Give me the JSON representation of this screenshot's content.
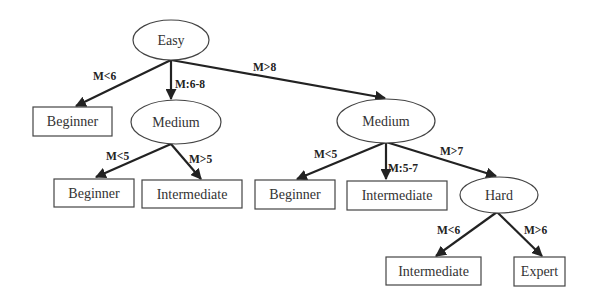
{
  "diagram": {
    "type": "decision-tree",
    "nodes": {
      "easy": {
        "label": "Easy",
        "shape": "ellipse"
      },
      "beginner_1": {
        "label": "Beginner",
        "shape": "rect"
      },
      "medium_left": {
        "label": "Medium",
        "shape": "ellipse"
      },
      "medium_right": {
        "label": "Medium",
        "shape": "ellipse"
      },
      "beginner_2": {
        "label": "Beginner",
        "shape": "rect"
      },
      "intermediate_1": {
        "label": "Intermediate",
        "shape": "rect"
      },
      "beginner_3": {
        "label": "Beginner",
        "shape": "rect"
      },
      "intermediate_2": {
        "label": "Intermediate",
        "shape": "rect"
      },
      "hard": {
        "label": "Hard",
        "shape": "ellipse"
      },
      "intermediate_3": {
        "label": "Intermediate",
        "shape": "rect"
      },
      "expert": {
        "label": "Expert",
        "shape": "rect"
      }
    },
    "edges": {
      "easy_beginner": {
        "from": "easy",
        "to": "beginner_1",
        "label": "M<6"
      },
      "easy_medium_left": {
        "from": "easy",
        "to": "medium_left",
        "label": "M:6-8"
      },
      "easy_medium_right": {
        "from": "easy",
        "to": "medium_right",
        "label": "M>8"
      },
      "medl_beginner": {
        "from": "medium_left",
        "to": "beginner_2",
        "label": "M<5"
      },
      "medl_intermediate": {
        "from": "medium_left",
        "to": "intermediate_1",
        "label": "M>5"
      },
      "medr_beginner": {
        "from": "medium_right",
        "to": "beginner_3",
        "label": "M<5"
      },
      "medr_intermediate": {
        "from": "medium_right",
        "to": "intermediate_2",
        "label": "M:5-7"
      },
      "medr_hard": {
        "from": "medium_right",
        "to": "hard",
        "label": "M>7"
      },
      "hard_intermediate": {
        "from": "hard",
        "to": "intermediate_3",
        "label": "M<6"
      },
      "hard_expert": {
        "from": "hard",
        "to": "expert",
        "label": "M>6"
      }
    }
  }
}
